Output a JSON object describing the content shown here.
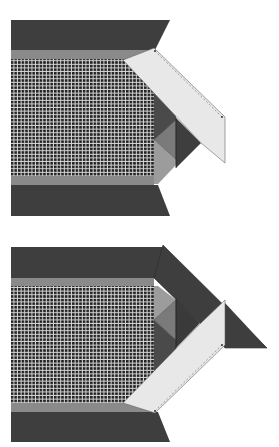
{
  "diagram": {
    "colors": {
      "background": "#ffffff",
      "dark_fabric": "#3e3e3e",
      "medium_stripe": "#8a8a8a",
      "diamond_medium": "#7a7a7a",
      "triangle_dark": "#4a4a4a",
      "light_gray": "#9c9c9c",
      "folded_strip": "#e8e8e8",
      "checker_dark": "#222222",
      "checker_light": "#d8d8d8",
      "outline": "#555555"
    },
    "steps": [
      {
        "id": "step-1",
        "label": "Top illustration: light border strip laid diagonally over corner"
      },
      {
        "id": "step-2",
        "label": "Bottom illustration: strip folded down along corner"
      }
    ]
  }
}
